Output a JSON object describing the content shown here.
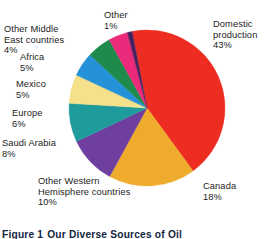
{
  "figure": {
    "caption_label": "Figure 1",
    "caption_title": "Our Diverse Sources of Oil"
  },
  "chart_data": {
    "type": "pie",
    "title": "Our Diverse Sources of Oil",
    "unit": "percent",
    "legend": "none",
    "labels_position": "outside",
    "total": 100,
    "categories": [
      "Domestic production",
      "Canada",
      "Other Western Hemisphere countries",
      "Saudi Arabia",
      "Europe",
      "Mexico",
      "Africa",
      "Other Middle East countries",
      "Other"
    ],
    "values": [
      43,
      18,
      10,
      8,
      6,
      5,
      5,
      4,
      1
    ],
    "colors": [
      "#ED2D21",
      "#EFAB2B",
      "#6F3FA0",
      "#1F9B9B",
      "#F5E08C",
      "#2591D8",
      "#1E8B4C",
      "#EC2A7B",
      "#4A2160"
    ],
    "slices": [
      {
        "name": "Domestic production",
        "value": 43,
        "value_text": "43%",
        "color": "#ED2D21"
      },
      {
        "name": "Canada",
        "value": 18,
        "value_text": "18%",
        "color": "#EFAB2B"
      },
      {
        "name": "Other Western Hemisphere countries",
        "value": 10,
        "value_text": "10%",
        "color": "#6F3FA0"
      },
      {
        "name": "Saudi Arabia",
        "value": 8,
        "value_text": "8%",
        "color": "#1F9B9B"
      },
      {
        "name": "Europe",
        "value": 6,
        "value_text": "6%",
        "color": "#F5E08C"
      },
      {
        "name": "Mexico",
        "value": 5,
        "value_text": "5%",
        "color": "#2591D8"
      },
      {
        "name": "Africa",
        "value": 5,
        "value_text": "5%",
        "color": "#1E8B4C"
      },
      {
        "name": "Other Middle East countries",
        "value": 4,
        "value_text": "4%",
        "color": "#EC2A7B"
      },
      {
        "name": "Other",
        "value": 1,
        "value_text": "1%",
        "color": "#4A2160"
      }
    ]
  },
  "labels": {
    "domestic": {
      "line1": "Domestic",
      "line2": "production",
      "value": "43%"
    },
    "canada": {
      "line1": "Canada",
      "value": "18%"
    },
    "other_western": {
      "line1": "Other Western",
      "line2": "Hemisphere countries",
      "value": "10%"
    },
    "saudi": {
      "line1": "Saudi Arabia",
      "value": "8%"
    },
    "europe": {
      "line1": "Europe",
      "value": "6%"
    },
    "mexico": {
      "line1": "Mexico",
      "value": "5%"
    },
    "africa": {
      "line1": "Africa",
      "value": "5%"
    },
    "other_mideast": {
      "line1": "Other Middle",
      "line2": "East countries",
      "value": "4%"
    },
    "other": {
      "line1": "Other",
      "value": "1%"
    }
  }
}
